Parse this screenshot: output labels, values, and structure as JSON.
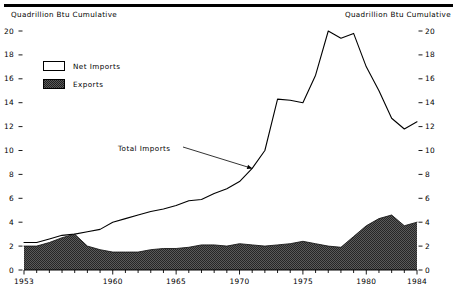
{
  "chart_data": {
    "type": "area",
    "title": "",
    "subtitle": "",
    "xlabel": "",
    "ylabel": "Quadrillion Btu Cumulative",
    "y2label": "Quadrillion Btu Cumulative",
    "xlim": [
      1953,
      1984
    ],
    "ylim": [
      0,
      20
    ],
    "yticks": [
      0,
      2,
      4,
      6,
      8,
      10,
      12,
      14,
      16,
      18,
      20
    ],
    "ytick_labels": [
      "0",
      "2",
      "4",
      "6",
      "8",
      "10",
      "12",
      "14",
      "16",
      "18",
      "20"
    ],
    "xticks": [
      1953,
      1960,
      1965,
      1970,
      1975,
      1980,
      1984
    ],
    "xtick_labels": [
      "1953",
      "1960",
      "1965",
      "1970",
      "1975",
      "1980",
      "1984"
    ],
    "minor_xticks_every": 1,
    "grid": false,
    "legend_position": "upper-left",
    "x": [
      1953,
      1954,
      1955,
      1956,
      1957,
      1958,
      1959,
      1960,
      1961,
      1962,
      1963,
      1964,
      1965,
      1966,
      1967,
      1968,
      1969,
      1970,
      1971,
      1972,
      1973,
      1974,
      1975,
      1976,
      1977,
      1978,
      1979,
      1980,
      1981,
      1982,
      1983,
      1984
    ],
    "series": [
      {
        "name": "Total Imports",
        "kind": "line",
        "values": [
          2.3,
          2.3,
          2.6,
          2.9,
          3.0,
          3.2,
          3.4,
          4.0,
          4.3,
          4.6,
          4.9,
          5.1,
          5.4,
          5.8,
          5.9,
          6.4,
          6.8,
          7.4,
          8.5,
          10.0,
          14.3,
          14.2,
          14.0,
          16.3,
          20.0,
          19.4,
          19.8,
          17.0,
          15.0,
          12.7,
          11.8,
          12.4
        ]
      },
      {
        "name": "Exports",
        "kind": "area-filled",
        "values": [
          2.0,
          2.0,
          2.3,
          2.7,
          3.0,
          2.0,
          1.7,
          1.5,
          1.5,
          1.5,
          1.7,
          1.8,
          1.8,
          1.9,
          2.1,
          2.1,
          2.0,
          2.2,
          2.1,
          2.0,
          2.1,
          2.2,
          2.4,
          2.2,
          2.0,
          1.9,
          2.8,
          3.7,
          4.3,
          4.6,
          3.7,
          4.0
        ]
      }
    ],
    "legend_entries": [
      {
        "label": "Net Imports",
        "swatch": "white-outline"
      },
      {
        "label": "Exports",
        "swatch": "dark-dither"
      }
    ],
    "annotations": [
      {
        "text": "Total Imports",
        "points_to_year": 1971,
        "points_to_value": 8.5
      }
    ],
    "colors": {
      "line": "#000000",
      "net_imports_fill": "#ffffff",
      "exports_fill": "#4a4a4a",
      "axis": "#000000",
      "background": "#ffffff"
    }
  }
}
